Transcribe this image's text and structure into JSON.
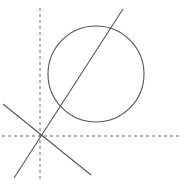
{
  "figure": {
    "canvas": {
      "width": 188,
      "height": 190,
      "background": "#ffffff"
    },
    "colors": {
      "stroke": "#555555",
      "axis": "#6b6b6b",
      "background": "#ffffff"
    },
    "strokes": {
      "curve_width": 1.1,
      "line_width": 1.1,
      "axis_width": 1.0,
      "axis_dash": "3,3"
    }
  },
  "chart_data": {
    "type": "scatter",
    "title": "",
    "xlabel": "",
    "ylabel": "",
    "grid": false,
    "legend": "none",
    "axes": {
      "origin_px": {
        "x": 40,
        "y": 136
      },
      "x_axis": {
        "from_px": {
          "x": 2,
          "y": 136
        },
        "to_px": {
          "x": 182,
          "y": 136
        },
        "style": "dashed"
      },
      "y_axis": {
        "from_px": {
          "x": 40,
          "y": 8
        },
        "to_px": {
          "x": 40,
          "y": 182
        },
        "style": "dashed"
      }
    },
    "shapes": [
      {
        "name": "circle",
        "type": "circle",
        "center_px": {
          "x": 96,
          "y": 74
        },
        "radius_px": 48,
        "style": "solid"
      },
      {
        "name": "rising-secant-line",
        "type": "line",
        "from_px": {
          "x": 14,
          "y": 178
        },
        "to_px": {
          "x": 123,
          "y": 9
        },
        "style": "solid"
      },
      {
        "name": "falling-line",
        "type": "line",
        "from_px": {
          "x": 3,
          "y": 104
        },
        "to_px": {
          "x": 91,
          "y": 175
        },
        "style": "solid"
      }
    ],
    "points": [
      {
        "name": "origin",
        "x_px": 40,
        "y_px": 136,
        "label": ""
      }
    ]
  }
}
